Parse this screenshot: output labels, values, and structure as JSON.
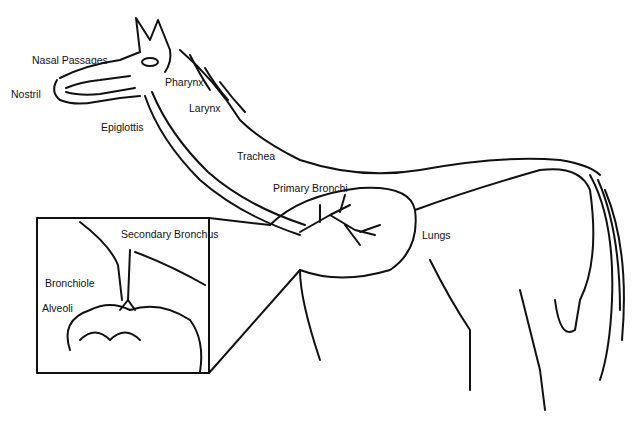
{
  "diagram": {
    "labels": {
      "nasal_passages": "Nasal Passages",
      "nostril": "Nostril",
      "pharynx": "Pharynx",
      "larynx": "Larynx",
      "epiglottis": "Epiglottis",
      "trachea": "Trachea",
      "primary_bronchi": "Primary Bronchi",
      "lungs": "Lungs",
      "secondary_bronchus": "Secondary Bronchus",
      "bronchiole": "Bronchiole",
      "alveoli": "Alveoli"
    }
  }
}
